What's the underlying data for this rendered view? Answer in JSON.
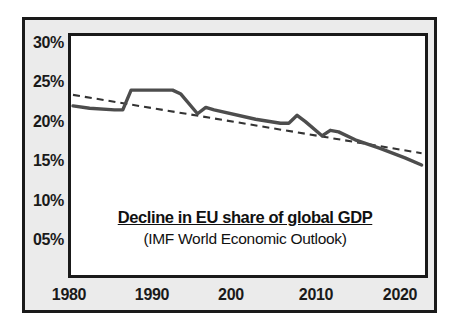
{
  "chart_data": {
    "type": "line",
    "title": "Decline in EU share of global GDP",
    "subtitle": "(IMF  World Economic Outlook)",
    "xlabel": "",
    "ylabel": "",
    "grid": false,
    "legend": "none",
    "xlim": [
      1980,
      2022
    ],
    "ylim": [
      0,
      32
    ],
    "x_tick_labels": [
      "1980",
      "1990",
      "200",
      "2010",
      "2020"
    ],
    "x_tick_values": [
      1980,
      1990,
      2000,
      2010,
      2020
    ],
    "y_tick_labels": [
      "30%",
      "25%",
      "20%",
      "15%",
      "10%",
      "05%"
    ],
    "y_tick_values": [
      30,
      25,
      20,
      15,
      10,
      5
    ],
    "series": [
      {
        "name": "EU share of global GDP",
        "style": "solid",
        "color": "#4d4d4d",
        "x": [
          1980,
          1982,
          1985,
          1986,
          1987,
          1992,
          1993,
          1995,
          1996,
          1997,
          2002,
          2005,
          2006,
          2007,
          2008,
          2010,
          2011,
          2012,
          2014,
          2017,
          2020,
          2022
        ],
        "values": [
          22.4,
          22.1,
          21.9,
          21.9,
          24.4,
          24.4,
          23.9,
          21.4,
          22.2,
          21.9,
          20.7,
          20.2,
          20.2,
          21.2,
          20.4,
          18.6,
          19.3,
          19.1,
          18.1,
          17.0,
          15.8,
          14.9
        ]
      },
      {
        "name": "Linear trend",
        "style": "dashed",
        "color": "#333333",
        "x": [
          1980,
          2022
        ],
        "values": [
          23.8,
          16.4
        ]
      }
    ]
  },
  "axes": {
    "y_ticks": [
      {
        "label": "30%",
        "value": 30
      },
      {
        "label": "25%",
        "value": 25
      },
      {
        "label": "20%",
        "value": 20
      },
      {
        "label": "15%",
        "value": 15
      },
      {
        "label": "10%",
        "value": 10
      },
      {
        "label": "05%",
        "value": 5
      }
    ],
    "x_ticks": [
      {
        "label": "1980",
        "value": 1980
      },
      {
        "label": "1990",
        "value": 1990
      },
      {
        "label": "200",
        "value": 2000
      },
      {
        "label": "2010",
        "value": 2010
      },
      {
        "label": "2020",
        "value": 2020
      }
    ]
  },
  "colors": {
    "card_background": "#ebebeb",
    "plot_background": "#ffffff",
    "frame": "#1a1a1a",
    "series_line": "#4d4d4d",
    "trend_line": "#333333",
    "text": "#1a1a1a"
  }
}
